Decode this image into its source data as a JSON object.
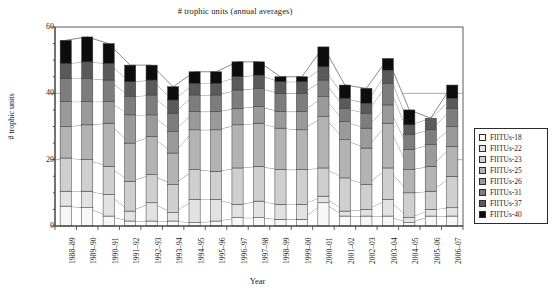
{
  "chart_data": {
    "type": "area",
    "subtype": "stacked-area-with-columns",
    "title": "# trophic units (annual averages)",
    "xlabel": "Year",
    "ylabel": "# trophic units",
    "ylim": [
      0,
      60
    ],
    "yticks": [
      0,
      20,
      40,
      60
    ],
    "grid": true,
    "legend_position": "right",
    "categories": [
      "1988–89",
      "1989–90",
      "1990–91",
      "1991–92",
      "1992–93",
      "1993–94",
      "1994–95",
      "1995–96",
      "1996–97",
      "1997–98",
      "1998–99",
      "1999–00",
      "2000–01",
      "2001–02",
      "2002–03",
      "2003–04",
      "2004–05",
      "2005–06",
      "2006–07"
    ],
    "series": [
      {
        "name": "FIITUs-18",
        "color": "#f7f7f7",
        "values": [
          6.0,
          5.5,
          3.0,
          1.5,
          1.5,
          1.5,
          1.0,
          1.5,
          2.5,
          2.5,
          2.0,
          2.0,
          7.0,
          3.0,
          3.0,
          3.0,
          1.0,
          3.0,
          3.0
        ]
      },
      {
        "name": "FIITUs-22",
        "color": "#e2e2e2",
        "values": [
          4.5,
          5.0,
          6.5,
          3.0,
          5.5,
          2.5,
          7.0,
          6.5,
          4.0,
          5.0,
          4.5,
          4.5,
          2.0,
          1.5,
          2.0,
          5.0,
          1.5,
          2.0,
          2.5
        ]
      },
      {
        "name": "FIITUs-23",
        "color": "#cfcfcf",
        "values": [
          10.0,
          9.5,
          8.5,
          9.0,
          8.5,
          8.5,
          9.0,
          8.5,
          11.0,
          10.5,
          10.5,
          10.5,
          8.5,
          10.0,
          7.5,
          9.5,
          7.5,
          5.5,
          9.5
        ]
      },
      {
        "name": "FIITUs-25",
        "color": "#b3b3b3",
        "values": [
          9.5,
          10.5,
          13.0,
          11.5,
          11.5,
          9.5,
          12.0,
          12.5,
          13.0,
          13.0,
          12.5,
          12.0,
          15.5,
          11.5,
          11.0,
          13.5,
          7.0,
          7.5,
          9.0
        ]
      },
      {
        "name": "FIITUs-26",
        "color": "#9a9a9a",
        "values": [
          7.5,
          7.0,
          6.5,
          8.5,
          6.5,
          6.5,
          5.5,
          5.5,
          5.0,
          5.0,
          5.0,
          5.5,
          6.0,
          5.5,
          6.0,
          5.5,
          6.0,
          6.5,
          6.0
        ]
      },
      {
        "name": "FIITUs-31",
        "color": "#7d7d7d",
        "values": [
          7.0,
          7.0,
          6.5,
          5.5,
          6.0,
          5.5,
          5.0,
          5.0,
          5.5,
          5.5,
          5.5,
          5.5,
          5.0,
          4.0,
          4.5,
          6.5,
          4.5,
          4.5,
          5.5
        ]
      },
      {
        "name": "FIITUs-37",
        "color": "#5a5a5a",
        "values": [
          4.5,
          5.0,
          5.0,
          4.5,
          4.5,
          4.0,
          3.5,
          3.5,
          4.0,
          4.0,
          3.5,
          3.5,
          4.0,
          3.0,
          3.0,
          4.0,
          3.0,
          3.5,
          3.0
        ]
      },
      {
        "name": "FIITUs-40",
        "color": "#0d0d0d",
        "values": [
          7.0,
          7.5,
          6.0,
          5.0,
          4.5,
          4.0,
          3.5,
          3.5,
          4.5,
          4.0,
          1.5,
          1.5,
          6.0,
          4.0,
          4.5,
          3.5,
          4.5,
          0.0,
          4.0
        ]
      }
    ],
    "totals": [
      56.0,
      57.0,
      55.0,
      48.5,
      48.5,
      42.0,
      46.5,
      46.5,
      49.5,
      49.5,
      45.0,
      45.0,
      54.0,
      42.5,
      41.5,
      50.5,
      35.0,
      32.5,
      42.5
    ]
  },
  "axis": {
    "y_ticks": [
      "0",
      "20",
      "40",
      "60"
    ],
    "x_title": "Year",
    "y_title": "# trophic units"
  },
  "legend": {
    "entries": [
      {
        "label": "FIITUs-18"
      },
      {
        "label": "FIITUs-22"
      },
      {
        "label": "FIITUs-23"
      },
      {
        "label": "FIITUs-25"
      },
      {
        "label": "FIITUs-26"
      },
      {
        "label": "FIITUs-31"
      },
      {
        "label": "FIITUs-37"
      },
      {
        "label": "FIITUs-40"
      }
    ]
  },
  "colors": {
    "axis": "#3a3a3a",
    "grid": "#8a8a8a",
    "frame": "#4a4a4a",
    "text": "#1b1b1b"
  }
}
